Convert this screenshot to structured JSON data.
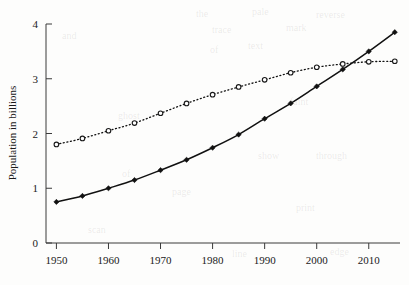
{
  "figure": {
    "background_color": "#fdfdfc",
    "ink_color": "#111111"
  },
  "chart_data": {
    "type": "line",
    "title": "",
    "subtitle": "",
    "xlabel": "",
    "ylabel": "Population in billions",
    "x": [
      1950,
      1955,
      1960,
      1965,
      1970,
      1975,
      1980,
      1985,
      1990,
      1995,
      2000,
      2005,
      2010,
      2015
    ],
    "xlim": [
      1948,
      2016
    ],
    "ylim": [
      0,
      4
    ],
    "xticks": [
      1950,
      1960,
      1970,
      1980,
      1990,
      2000,
      2010
    ],
    "xtick_labels": [
      "1950",
      "1960",
      "1970",
      "1980",
      "1990",
      "2000",
      "2010"
    ],
    "yticks": [
      0,
      1,
      2,
      3,
      4
    ],
    "ytick_labels": [
      "0",
      "1",
      "2",
      "3",
      "4"
    ],
    "grid": false,
    "legend": false,
    "legend_position": "none",
    "series": [
      {
        "name": "solid-line-series",
        "marker": "filled-diamond",
        "linestyle": "solid",
        "color": "#111111",
        "values": [
          0.75,
          0.86,
          1.0,
          1.15,
          1.33,
          1.52,
          1.74,
          1.98,
          2.27,
          2.55,
          2.86,
          3.17,
          3.5,
          3.85
        ]
      },
      {
        "name": "dotted-line-series",
        "marker": "open-circle",
        "linestyle": "dotted",
        "color": "#111111",
        "values": [
          1.8,
          1.91,
          2.05,
          2.19,
          2.37,
          2.55,
          2.71,
          2.85,
          2.98,
          3.11,
          3.21,
          3.27,
          3.31,
          3.32
        ]
      }
    ]
  },
  "bleed_through": [
    {
      "text": "the",
      "x": 196,
      "y": 8
    },
    {
      "text": "pale",
      "x": 252,
      "y": 6
    },
    {
      "text": "reverse",
      "x": 316,
      "y": 9
    },
    {
      "text": "and",
      "x": 62,
      "y": 30
    },
    {
      "text": "trace",
      "x": 212,
      "y": 24
    },
    {
      "text": "mark",
      "x": 286,
      "y": 22
    },
    {
      "text": "of",
      "x": 210,
      "y": 44
    },
    {
      "text": "text",
      "x": 248,
      "y": 40
    },
    {
      "text": "ghost",
      "x": 118,
      "y": 110
    },
    {
      "text": "faint",
      "x": 290,
      "y": 96
    },
    {
      "text": "show",
      "x": 258,
      "y": 150
    },
    {
      "text": "through",
      "x": 316,
      "y": 150
    },
    {
      "text": "of",
      "x": 122,
      "y": 168
    },
    {
      "text": "page",
      "x": 172,
      "y": 186
    },
    {
      "text": "print",
      "x": 296,
      "y": 202
    },
    {
      "text": "scan",
      "x": 88,
      "y": 224
    },
    {
      "text": "line",
      "x": 232,
      "y": 248
    },
    {
      "text": "edge",
      "x": 330,
      "y": 246
    }
  ]
}
